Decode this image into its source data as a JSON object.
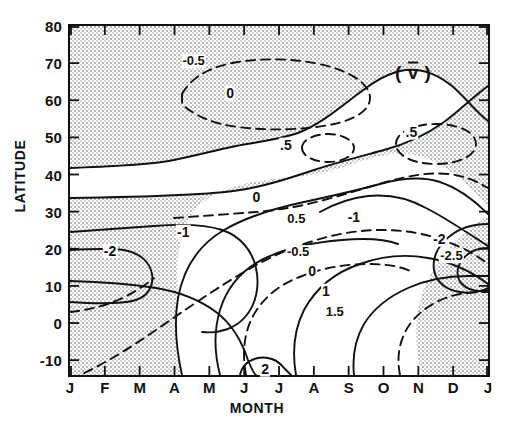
{
  "figure": {
    "panel_label": "( v̄ )",
    "panel_label_symbol": "v",
    "axis_x_title": "MONTH",
    "axis_y_title": "LATITUDE"
  },
  "chart_data": {
    "type": "line",
    "xlabel": "MONTH",
    "ylabel": "LATITUDE",
    "xlim": [
      0,
      12
    ],
    "ylim": [
      -14,
      80
    ],
    "grid": false,
    "legend": "none",
    "x_tick_labels": [
      "J",
      "F",
      "M",
      "A",
      "M",
      "J",
      "J",
      "A",
      "S",
      "O",
      "N",
      "D",
      "J"
    ],
    "x_tick_values": [
      0,
      1,
      2,
      3,
      4,
      5,
      6,
      7,
      8,
      9,
      10,
      11,
      12
    ],
    "y_tick_labels": [
      "80",
      "70",
      "60",
      "50",
      "40",
      "30",
      "20",
      "10",
      "0",
      "-10"
    ],
    "y_tick_values": [
      80,
      70,
      60,
      50,
      40,
      30,
      20,
      10,
      0,
      -10
    ],
    "contour_levels": [
      -2.5,
      -2,
      -1.5,
      -1,
      -0.5,
      0,
      0.5,
      1,
      1.5,
      2
    ],
    "shaded_meaning": "negative values (stippled)",
    "contour_labels": [
      {
        "text": "-0.5",
        "x": 3.55,
        "y": 70.5,
        "style": "dashed"
      },
      {
        "text": "0",
        "x": 4.6,
        "y": 62.0,
        "style": "solid"
      },
      {
        "text": ".5",
        "x": 6.2,
        "y": 48.0,
        "style": "dashed"
      },
      {
        "text": ".5",
        "x": 9.8,
        "y": 51.5,
        "style": "dashed"
      },
      {
        "text": "0",
        "x": 5.35,
        "y": 34.0,
        "style": "solid"
      },
      {
        "text": "0.5",
        "x": 6.5,
        "y": 28.0,
        "style": "dashed"
      },
      {
        "text": "-1",
        "x": 3.25,
        "y": 24.5,
        "style": "solid"
      },
      {
        "text": "-2",
        "x": 1.15,
        "y": 19.5,
        "style": "solid"
      },
      {
        "text": "-0.5",
        "x": 6.55,
        "y": 19.0,
        "style": "dashed"
      },
      {
        "text": "0",
        "x": 6.95,
        "y": 14.0,
        "style": "solid"
      },
      {
        "text": "-1",
        "x": 8.15,
        "y": 28.5,
        "style": "solid"
      },
      {
        "text": "-2",
        "x": 10.6,
        "y": 22.5,
        "style": "solid"
      },
      {
        "text": "-2.5",
        "x": 10.95,
        "y": 18.0,
        "style": "solid"
      },
      {
        "text": "1",
        "x": 7.35,
        "y": 8.5,
        "style": "solid"
      },
      {
        "text": "1.5",
        "x": 7.6,
        "y": 3.0,
        "style": "dashed"
      },
      {
        "text": "2",
        "x": 5.6,
        "y": -12.5,
        "style": "solid"
      }
    ]
  }
}
